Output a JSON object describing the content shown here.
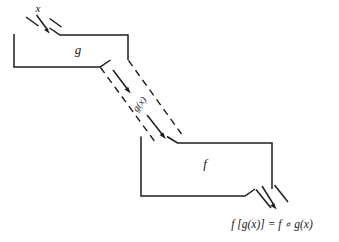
{
  "figure": {
    "type": "function-composition-machine-diagram",
    "background_color": "#ffffff",
    "ink_color": "#1c1c1c"
  },
  "input": {
    "label": "x",
    "description": "input value entering machine g"
  },
  "machines": [
    {
      "id": "g",
      "label": "g",
      "role": "inner-function"
    },
    {
      "id": "f",
      "label": "f",
      "role": "outer-function"
    }
  ],
  "channel": {
    "label": "g(x)",
    "style": "dashed",
    "description": "output of g flowing into f"
  },
  "output": {
    "label": "f [g(x)]  =  f ∘ g(x)",
    "parts": {
      "composite_bracket": "f [g(x)]",
      "equals": "=",
      "composite_ring": "f ∘ g(x)"
    }
  },
  "arrows": [
    {
      "name": "input-arrow",
      "from": "x",
      "to": "g"
    },
    {
      "name": "channel-arrow-upper",
      "from": "g",
      "to": "channel"
    },
    {
      "name": "channel-arrow-lower",
      "from": "channel",
      "to": "f"
    },
    {
      "name": "output-arrow",
      "from": "f",
      "to": "result"
    }
  ]
}
